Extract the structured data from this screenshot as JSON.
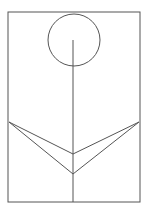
{
  "canvas": {
    "width": 148,
    "height": 211,
    "background": "#ffffff"
  },
  "style": {
    "stroke": "#555555",
    "stroke_width": 1
  },
  "diagram": {
    "title": "",
    "frame": {
      "x": 8,
      "y": 12,
      "width": 132,
      "height": 190
    },
    "flower_head": {
      "cx": 74,
      "cy": 40,
      "r": 26
    },
    "stem": {
      "x1": 73,
      "y1": 40,
      "x2": 73,
      "y2": 202
    },
    "leaves": [
      {
        "name": "left-leaf",
        "points": "9,122 73,154 9,122 73,174"
      },
      {
        "name": "right-leaf",
        "points": "139,122 73,154 139,122 73,174"
      }
    ]
  }
}
